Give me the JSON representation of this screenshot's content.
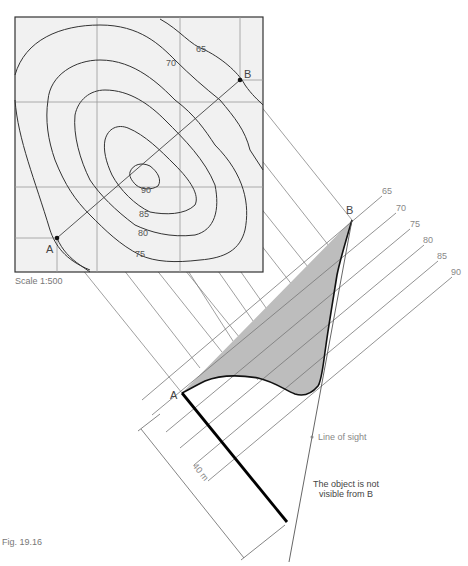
{
  "figure": {
    "caption": "Fig. 19.16",
    "scale_label": "Scale 1:500",
    "point_a": "A",
    "point_b": "B",
    "contour_labels": [
      "65",
      "70",
      "75",
      "80",
      "85",
      "90"
    ],
    "elevation_labels": [
      "65",
      "70",
      "75",
      "80",
      "85",
      "90"
    ],
    "distance_label": "40 m",
    "line_of_sight_label": "Line of sight",
    "note_line1": "The object is not",
    "note_line2": "visible from B"
  },
  "colors": {
    "map_fill": "#f1f1f1",
    "profile_fill": "#bdbdbd",
    "line": "#555555",
    "contour": "#333333",
    "object": "#000000"
  }
}
